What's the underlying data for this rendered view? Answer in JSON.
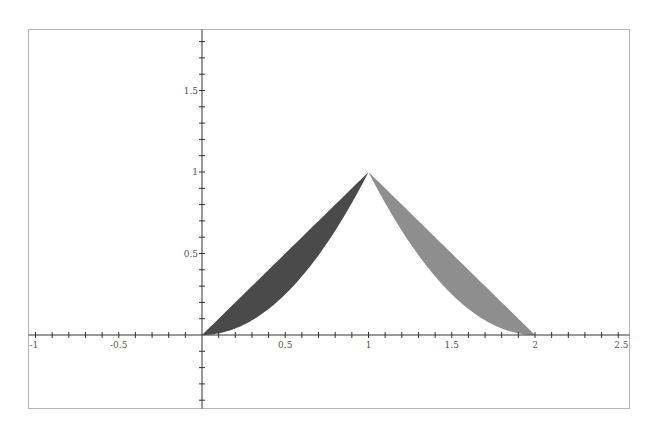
{
  "chart_data": {
    "type": "area",
    "title": "",
    "xlabel": "",
    "ylabel": "",
    "xlim": [
      -1.03,
      2.53
    ],
    "ylim": [
      -0.45,
      1.88
    ],
    "grid": false,
    "legend": null,
    "x_ticks": {
      "major": [
        -1,
        -0.5,
        0.5,
        1,
        1.5,
        2,
        2.5
      ],
      "labels": [
        "-1",
        "-0.5",
        "0.5",
        "1",
        "1.5",
        "2",
        "2.5"
      ],
      "minor_step": 0.1
    },
    "y_ticks": {
      "major": [
        0.5,
        1,
        1.5
      ],
      "labels": [
        "0.5",
        "1",
        "1.5"
      ],
      "minor_step": 0.1
    },
    "series": [
      {
        "name": "left-region",
        "description": "region between y = x (upper) and y = x^2 (lower) for x in [0, 1]",
        "x_range": [
          0,
          1
        ],
        "upper": "x",
        "lower": "x^2",
        "color": "#4a4a4a"
      },
      {
        "name": "right-region",
        "description": "region between y = 2 - x (upper) and y = (2 - x)^2 (lower) for x in [1, 2]",
        "x_range": [
          1,
          2
        ],
        "upper": "2 - x",
        "lower": "(2 - x)^2",
        "color": "#8e8e8e"
      }
    ],
    "key_points": [
      {
        "x": 0,
        "y": 0
      },
      {
        "x": 1,
        "y": 1
      },
      {
        "x": 2,
        "y": 0
      }
    ]
  },
  "colors": {
    "axis": "#333333",
    "frame": "#b5b5b5",
    "left_fill": "#4a4a4a",
    "right_fill": "#8e8e8e"
  }
}
